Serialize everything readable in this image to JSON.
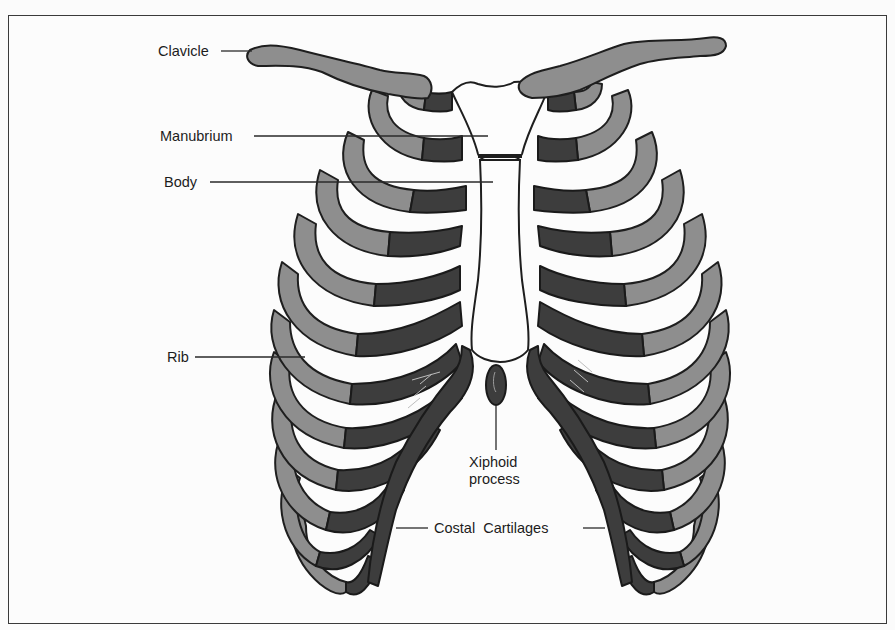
{
  "figure": {
    "colors": {
      "bone": "#8e8e8e",
      "cartilage": "#3d3d3d",
      "outline": "#1e1e1e",
      "background": "#fcfcfc"
    }
  },
  "labels": {
    "clavicle": "Clavicle",
    "manubrium": "Manubrium",
    "body": "Body",
    "rib": "Rib",
    "xiphoid_line1": "Xiphoid",
    "xiphoid_line2": "process",
    "costal_cartilages": "Costal  Cartilages"
  }
}
